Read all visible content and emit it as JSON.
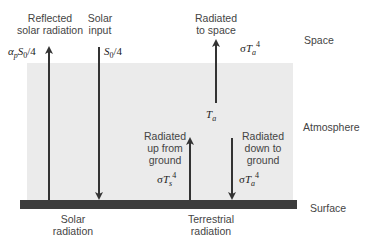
{
  "layers": {
    "space": "Space",
    "atmosphere": "Atmosphere",
    "surface": "Surface"
  },
  "top_labels": {
    "reflected_line1": "Reflected",
    "reflected_line2": "solar radiation",
    "solar_input_line1": "Solar",
    "solar_input_line2": "input",
    "radiated_space_line1": "Radiated",
    "radiated_space_line2": "to space"
  },
  "mid_labels": {
    "up_line1": "Radiated",
    "up_line2": "up from",
    "up_line3": "ground",
    "down_line1": "Radiated",
    "down_line2": "down to",
    "down_line3": "ground"
  },
  "bottom_labels": {
    "solar_line1": "Solar",
    "solar_line2": "radiation",
    "terrestrial_line1": "Terrestrial",
    "terrestrial_line2": "radiation"
  },
  "math": {
    "reflected_flux": "αpS0/4",
    "solar_flux": "S0/4",
    "space_flux": "σTa^4",
    "atm_temp": "Ta",
    "ground_up_flux": "σTs^4",
    "down_flux": "σTa^4"
  },
  "colors": {
    "atmosphere_fill": "#ebebeb",
    "surface_fill": "#3c3c3c",
    "arrow": "#333333"
  }
}
